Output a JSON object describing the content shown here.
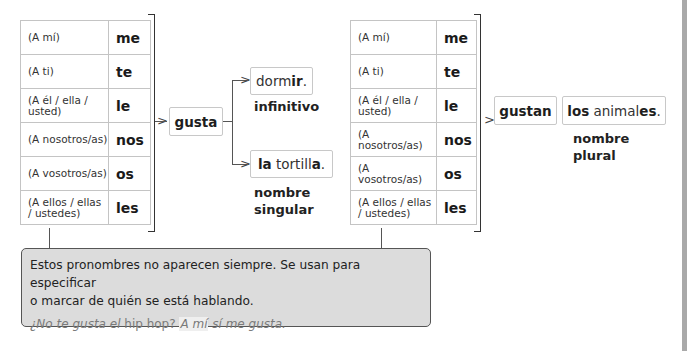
{
  "left_table": {
    "rows": [
      {
        "label": "(A mí)",
        "pronoun": "me"
      },
      {
        "label": "(A ti)",
        "pronoun": "te"
      },
      {
        "label": "(A él / ella / usted)",
        "pronoun": "le"
      },
      {
        "label": "(A nosotros/as)",
        "pronoun": "nos"
      },
      {
        "label": "(A vosotros/as)",
        "pronoun": "os"
      },
      {
        "label": "(A ellos / ellas / ustedes)",
        "pronoun": "les"
      }
    ]
  },
  "right_table": {
    "rows": [
      {
        "label": "(A mí)",
        "pronoun": "me"
      },
      {
        "label": "(A ti)",
        "pronoun": "te"
      },
      {
        "label": "(A él / ella / usted)",
        "pronoun": "le"
      },
      {
        "label": "(A nosotros/as)",
        "pronoun": "nos"
      },
      {
        "label": "(A vosotros/as)",
        "pronoun": "os"
      },
      {
        "label": "(A ellos / ellas / ustedes)",
        "pronoun": "les"
      }
    ]
  },
  "singular": {
    "verb": "gusta",
    "option1": {
      "stem": "dorm",
      "ending": "ir",
      "punct": ".",
      "caption": "infinitivo"
    },
    "option2": {
      "article": "la",
      "stem": "tortill",
      "ending": "a",
      "punct": ".",
      "caption_line1": "nombre",
      "caption_line2": "singular"
    }
  },
  "plural": {
    "verb": "gustan",
    "noun": {
      "article": "los",
      "stem": "animal",
      "ending": "es",
      "punct": ".",
      "caption_line1": "nombre",
      "caption_line2": "plural"
    }
  },
  "note": {
    "text_line1": "Estos pronombres no aparecen siempre. Se usan para especificar",
    "text_line2": "o marcar de quién se está hablando.",
    "example_part1": "¿No te gusta el ",
    "example_part2": "hip hop",
    "example_part3": "? ",
    "example_part4": "A mí",
    "example_part5": " sí me gusta."
  },
  "colors": {
    "note_background": "#dcdcdc",
    "border": "#c4c4c4",
    "example_text": "#7a7a7a"
  }
}
